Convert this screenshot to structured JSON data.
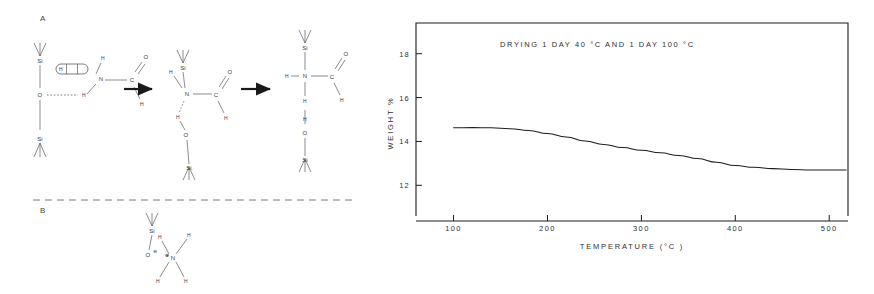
{
  "figure": {
    "panels": [
      {
        "id": "A",
        "label": "A"
      },
      {
        "id": "B",
        "label": "B"
      }
    ]
  },
  "panel_a": {
    "label": "A",
    "arrow_1": "→",
    "arrow_2": "→",
    "structure_1": {
      "name": "silanol-hydrogen-bonded-formamide",
      "atoms": [
        {
          "key": "si_top",
          "text": "Si"
        },
        {
          "key": "o_bridge",
          "text": "O"
        },
        {
          "key": "si_bottom",
          "text": "Si"
        },
        {
          "key": "n",
          "text": "N"
        },
        {
          "key": "h_n_top",
          "text": "H"
        },
        {
          "key": "h_n_bottom",
          "text": "H"
        },
        {
          "key": "c",
          "text": "C"
        },
        {
          "key": "o_carbonyl",
          "text": "O"
        },
        {
          "key": "h_formyl",
          "text": "H"
        },
        {
          "key": "h_boxed",
          "text": "H"
        }
      ]
    },
    "structure_2": {
      "name": "transition-intermediate",
      "atoms": [
        {
          "key": "si_top",
          "text": "Si"
        },
        {
          "key": "n",
          "text": "N"
        },
        {
          "key": "h_left",
          "text": "H"
        },
        {
          "key": "h_lower",
          "text": "H"
        },
        {
          "key": "o_bridge",
          "text": "O"
        },
        {
          "key": "si_bottom",
          "text": "Si"
        },
        {
          "key": "c",
          "text": "C"
        },
        {
          "key": "o_carbonyl",
          "text": "O"
        },
        {
          "key": "h_formyl",
          "text": "H"
        }
      ]
    },
    "structure_3": {
      "name": "silylamide-product",
      "atoms": [
        {
          "key": "si_top",
          "text": "Si"
        },
        {
          "key": "n",
          "text": "N"
        },
        {
          "key": "h_left",
          "text": "H"
        },
        {
          "key": "h_below_n",
          "text": "H"
        },
        {
          "key": "h_silanol",
          "text": "H"
        },
        {
          "key": "o_bridge",
          "text": "O"
        },
        {
          "key": "si_bottom",
          "text": "Si"
        },
        {
          "key": "c",
          "text": "C"
        },
        {
          "key": "o_carbonyl",
          "text": "O"
        },
        {
          "key": "h_formyl",
          "text": "H"
        }
      ]
    }
  },
  "panel_b": {
    "label": "B",
    "structure": {
      "name": "siloxide-ammonium-ion-pair",
      "atoms": [
        {
          "key": "si",
          "text": "Si"
        },
        {
          "key": "o_minus",
          "text": "O"
        },
        {
          "key": "o_charge",
          "text": "⊖"
        },
        {
          "key": "n_plus",
          "text": "N"
        },
        {
          "key": "n_charge",
          "text": "⊕"
        },
        {
          "key": "h_up_left",
          "text": "H"
        },
        {
          "key": "h_up_right",
          "text": "H"
        },
        {
          "key": "h_down_left",
          "text": "H"
        },
        {
          "key": "h_down_right",
          "text": "H"
        }
      ]
    }
  },
  "chart_data": {
    "type": "line",
    "title": "DRYING   1 DAY  40 °C   AND   1 DAY   100 °C",
    "xlabel": "TEMPERATURE   (°C )",
    "ylabel": "WEIGHT  %",
    "xlim": [
      60,
      520
    ],
    "ylim": [
      10.6,
      19.4
    ],
    "xticks": [
      100,
      200,
      300,
      400,
      500
    ],
    "xtick_labels": [
      "100",
      "200",
      "300",
      "400",
      "500"
    ],
    "yticks": [
      12,
      14,
      16,
      18
    ],
    "ytick_labels": [
      "12",
      "14",
      "16",
      "18"
    ],
    "grid": false,
    "legend": null,
    "series": [
      {
        "name": "weight loss",
        "x": [
          100,
          120,
          140,
          160,
          180,
          200,
          220,
          240,
          260,
          280,
          300,
          320,
          340,
          360,
          380,
          400,
          420,
          440,
          460,
          480,
          500,
          518
        ],
        "y": [
          14.62,
          14.63,
          14.62,
          14.58,
          14.5,
          14.36,
          14.2,
          14.02,
          13.86,
          13.72,
          13.6,
          13.48,
          13.36,
          13.22,
          13.05,
          12.9,
          12.82,
          12.76,
          12.72,
          12.7,
          12.7,
          12.7
        ]
      }
    ]
  }
}
